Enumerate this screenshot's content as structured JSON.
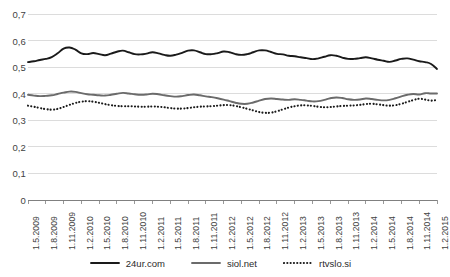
{
  "chart_data": {
    "type": "line",
    "title": "",
    "subtitle": "",
    "xlabel": "",
    "ylabel": "",
    "ylim": [
      0,
      0.7
    ],
    "grid": true,
    "legend_position": "bottom",
    "y_ticks": [
      "0",
      "0,1",
      "0,2",
      "0,3",
      "0,4",
      "0,5",
      "0,6",
      "0,7"
    ],
    "y_tick_values": [
      0,
      0.1,
      0.2,
      0.3,
      0.4,
      0.5,
      0.6,
      0.7
    ],
    "x_tick_labels": [
      "1.5.2009",
      "1.8.2009",
      "1.11.2009",
      "1.2.2010",
      "1.5.2010",
      "1.8.2010",
      "1.11.2010",
      "1.2.2011",
      "1.5.2011",
      "1.8.2011",
      "1.11.2011",
      "1.2.2012",
      "1.5.2012",
      "1.8.2012",
      "1.11.2012",
      "1.2.2013",
      "1.5.2013",
      "1.8.2013",
      "1.11.2013",
      "1.2.2014",
      "1.5.2014",
      "1.8.2014",
      "1.11.2014",
      "1.2.2015"
    ],
    "categories": [
      "1.5.2009",
      "1.6.2009",
      "1.7.2009",
      "1.8.2009",
      "1.9.2009",
      "1.10.2009",
      "1.11.2009",
      "1.12.2009",
      "1.1.2010",
      "1.2.2010",
      "1.3.2010",
      "1.4.2010",
      "1.5.2010",
      "1.6.2010",
      "1.7.2010",
      "1.8.2010",
      "1.9.2010",
      "1.10.2010",
      "1.11.2010",
      "1.12.2010",
      "1.1.2011",
      "1.2.2011",
      "1.3.2011",
      "1.4.2011",
      "1.5.2011",
      "1.6.2011",
      "1.7.2011",
      "1.8.2011",
      "1.9.2011",
      "1.10.2011",
      "1.11.2011",
      "1.12.2011",
      "1.1.2012",
      "1.2.2012",
      "1.3.2012",
      "1.4.2012",
      "1.5.2012",
      "1.6.2012",
      "1.7.2012",
      "1.8.2012",
      "1.9.2012",
      "1.10.2012",
      "1.11.2012",
      "1.12.2012",
      "1.1.2013",
      "1.2.2013",
      "1.3.2013",
      "1.4.2013",
      "1.5.2013",
      "1.6.2013",
      "1.7.2013",
      "1.8.2013",
      "1.9.2013",
      "1.10.2013",
      "1.11.2013",
      "1.12.2013",
      "1.1.2014",
      "1.2.2014",
      "1.3.2014",
      "1.4.2014",
      "1.5.2014",
      "1.6.2014",
      "1.7.2014",
      "1.8.2014",
      "1.9.2014",
      "1.10.2014",
      "1.11.2014",
      "1.12.2014",
      "1.1.2015",
      "1.2.2015"
    ],
    "series": [
      {
        "name": "24ur.com",
        "color": "#1a1a1a",
        "style": "solid",
        "width": 1.9,
        "values": [
          0.519,
          0.522,
          0.527,
          0.531,
          0.538,
          0.552,
          0.57,
          0.574,
          0.566,
          0.552,
          0.549,
          0.553,
          0.549,
          0.545,
          0.551,
          0.558,
          0.562,
          0.556,
          0.549,
          0.548,
          0.551,
          0.556,
          0.552,
          0.546,
          0.543,
          0.547,
          0.554,
          0.562,
          0.563,
          0.556,
          0.549,
          0.549,
          0.553,
          0.559,
          0.556,
          0.549,
          0.546,
          0.549,
          0.556,
          0.563,
          0.563,
          0.557,
          0.55,
          0.548,
          0.543,
          0.541,
          0.537,
          0.534,
          0.53,
          0.533,
          0.539,
          0.545,
          0.543,
          0.536,
          0.531,
          0.531,
          0.534,
          0.537,
          0.533,
          0.528,
          0.524,
          0.52,
          0.525,
          0.531,
          0.533,
          0.528,
          0.522,
          0.519,
          0.512,
          0.493
        ]
      },
      {
        "name": "siol.net",
        "color": "#6b6b6b",
        "style": "solid",
        "width": 1.9,
        "values": [
          0.396,
          0.393,
          0.391,
          0.392,
          0.394,
          0.399,
          0.404,
          0.408,
          0.407,
          0.402,
          0.398,
          0.396,
          0.394,
          0.393,
          0.396,
          0.4,
          0.403,
          0.401,
          0.398,
          0.396,
          0.397,
          0.4,
          0.398,
          0.394,
          0.391,
          0.389,
          0.391,
          0.395,
          0.397,
          0.394,
          0.39,
          0.387,
          0.383,
          0.378,
          0.372,
          0.366,
          0.362,
          0.362,
          0.367,
          0.374,
          0.38,
          0.382,
          0.38,
          0.378,
          0.377,
          0.379,
          0.377,
          0.374,
          0.371,
          0.372,
          0.377,
          0.383,
          0.386,
          0.384,
          0.379,
          0.377,
          0.378,
          0.382,
          0.38,
          0.377,
          0.375,
          0.377,
          0.383,
          0.39,
          0.396,
          0.399,
          0.397,
          0.402,
          0.401,
          0.401
        ]
      },
      {
        "name": "rtvslo.si",
        "color": "#1a1a1a",
        "style": "dotted",
        "width": 2.1,
        "values": [
          0.355,
          0.351,
          0.346,
          0.342,
          0.34,
          0.343,
          0.35,
          0.358,
          0.365,
          0.37,
          0.372,
          0.37,
          0.366,
          0.361,
          0.357,
          0.354,
          0.353,
          0.353,
          0.352,
          0.351,
          0.351,
          0.352,
          0.351,
          0.349,
          0.346,
          0.344,
          0.344,
          0.346,
          0.349,
          0.351,
          0.352,
          0.353,
          0.355,
          0.357,
          0.357,
          0.354,
          0.349,
          0.343,
          0.337,
          0.331,
          0.328,
          0.329,
          0.334,
          0.341,
          0.348,
          0.353,
          0.356,
          0.356,
          0.354,
          0.351,
          0.349,
          0.35,
          0.352,
          0.354,
          0.355,
          0.356,
          0.358,
          0.361,
          0.362,
          0.36,
          0.357,
          0.355,
          0.357,
          0.362,
          0.369,
          0.376,
          0.381,
          0.378,
          0.374,
          0.377
        ]
      }
    ]
  },
  "legend": {
    "items": [
      {
        "label": "24ur.com"
      },
      {
        "label": "siol.net"
      },
      {
        "label": "rtvslo.si"
      }
    ]
  },
  "axis_colors": {
    "grid": "#d3d3d3",
    "axis": "#808080",
    "tick_text": "#3f3f3f"
  }
}
